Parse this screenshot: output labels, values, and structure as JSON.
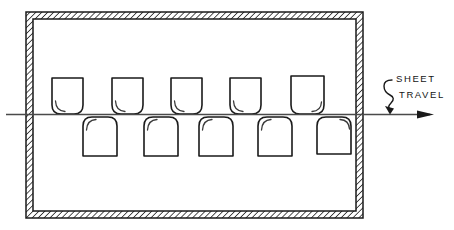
{
  "diagram": {
    "ink_color": "#1a1a1a",
    "background_color": "#ffffff",
    "chamber": {
      "name": "hatched-wall-chamber",
      "outer": {
        "x": 26,
        "y": 12,
        "width": 337,
        "height": 206
      },
      "wall_thickness": 7,
      "hatch_angle_deg": 45,
      "hatch_spacing": 3
    },
    "travel_line": {
      "label_line_1": "SHEET",
      "label_line_2": "TRAVEL",
      "y": 114,
      "x_start": 6,
      "x_end": 440,
      "arrow_direction": "right",
      "line_color": "#4a4a4a"
    },
    "upper_nozzles": {
      "count": 5,
      "y_top": 78,
      "height": 36,
      "width": 31,
      "corner_style": "rounded-bottom",
      "x_positions": [
        52,
        104,
        169,
        228,
        288
      ]
    },
    "lower_nozzles": {
      "count": 5,
      "y_top": 116,
      "height": 40,
      "width": 34,
      "corner_style": "rounded-top",
      "x_positions": [
        83,
        144,
        199,
        258,
        317
      ]
    }
  }
}
